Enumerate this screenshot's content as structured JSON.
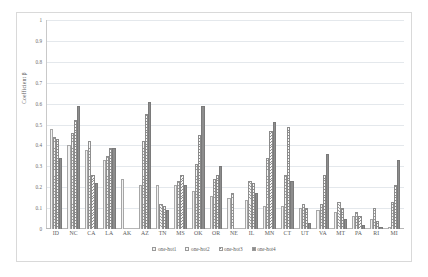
{
  "chart_data": {
    "type": "bar",
    "title": "",
    "xlabel": "",
    "ylabel": "Coefficient β",
    "ylim": [
      0,
      1
    ],
    "ytick_labels": [
      "1",
      "0.9",
      "0.8",
      "0.7",
      "0.6",
      "0.5",
      "0.4",
      "0.3",
      "0.2",
      "0.1",
      "0"
    ],
    "ytick_values": [
      1,
      0.9,
      0.8,
      0.7,
      0.6,
      0.5,
      0.4,
      0.3,
      0.2,
      0.1,
      0
    ],
    "grid": true,
    "legend_position": "bottom",
    "categories": [
      "ID",
      "NC",
      "CA",
      "LA",
      "AK",
      "AZ",
      "TN",
      "MS",
      "OK",
      "OR",
      "NE",
      "IL",
      "MN",
      "CT",
      "UT",
      "VA",
      "MT",
      "PA",
      "RI",
      "MI"
    ],
    "series": [
      {
        "name": "one-hot1",
        "color": "#f2f2f2",
        "values": [
          0.48,
          0.4,
          0.38,
          0.33,
          0.24,
          0.21,
          0.21,
          0.21,
          0.18,
          0.16,
          0.15,
          0.14,
          0.11,
          0.11,
          0.1,
          0.09,
          0.08,
          0.06,
          0.05,
          0.01
        ]
      },
      {
        "name": "one-hot2",
        "color": "#9b9b9b",
        "values": [
          0.44,
          0.46,
          0.42,
          0.35,
          0.0,
          0.42,
          0.12,
          0.23,
          0.31,
          0.24,
          0.17,
          0.23,
          0.34,
          0.26,
          0.12,
          0.12,
          0.13,
          0.08,
          0.1,
          0.13
        ]
      },
      {
        "name": "one-hot3",
        "color": "#8e8e8e",
        "values": [
          0.43,
          0.52,
          0.26,
          0.39,
          0.0,
          0.55,
          0.11,
          0.26,
          0.45,
          0.26,
          0.0,
          0.22,
          0.47,
          0.49,
          0.1,
          0.26,
          0.1,
          0.06,
          0.04,
          0.21
        ]
      },
      {
        "name": "one-hot4",
        "color": "#8d8d8d",
        "values": [
          0.34,
          0.59,
          0.22,
          0.39,
          0.0,
          0.61,
          0.09,
          0.21,
          0.59,
          0.3,
          0.0,
          0.17,
          0.51,
          0.23,
          0.03,
          0.36,
          0.05,
          0.02,
          0.01,
          0.33
        ]
      }
    ]
  },
  "legend": {
    "items": [
      {
        "label": "one-hot1"
      },
      {
        "label": "one-hot2"
      },
      {
        "label": "one-hot3"
      },
      {
        "label": "one-hot4"
      }
    ]
  }
}
